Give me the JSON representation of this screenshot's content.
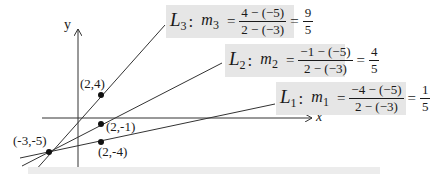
{
  "axes": {
    "x_label": "x",
    "y_label": "y"
  },
  "points": [
    {
      "id": "p_origin",
      "label": "(-3,-5)",
      "x": -3,
      "y": -5
    },
    {
      "id": "p_l3",
      "label": "(2,4)",
      "x": 2,
      "y": 4
    },
    {
      "id": "p_l2",
      "label": "(2,-1)",
      "x": 2,
      "y": -1
    },
    {
      "id": "p_l1",
      "label": "(2,-4)",
      "x": 2,
      "y": -4
    }
  ],
  "lines": [
    {
      "name": "L",
      "index": "3",
      "slope_var": "m",
      "numerator": "4 − (−5)",
      "denominator": "2 − (−3)",
      "result_num": "9",
      "result_den": "5"
    },
    {
      "name": "L",
      "index": "2",
      "slope_var": "m",
      "numerator": "−1 − (−5)",
      "denominator": "2 − (−3)",
      "result_num": "4",
      "result_den": "5"
    },
    {
      "name": "L",
      "index": "1",
      "slope_var": "m",
      "numerator": "−4 − (−5)",
      "denominator": "2 − (−3)",
      "result_num": "1",
      "result_den": "5"
    }
  ],
  "colors": {
    "line": "#333333",
    "label_bg": "#e6e6e6",
    "point": "#111111"
  }
}
